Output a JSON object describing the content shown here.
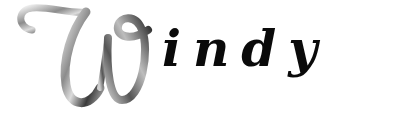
{
  "logo": {
    "word": "Windy",
    "initial": "W",
    "rest": "indy",
    "colors": {
      "initial_light": "#e8e8e8",
      "initial_mid": "#9a9a9a",
      "initial_dark": "#2a2a2a",
      "text": "#0a0a0a",
      "background": "#ffffff"
    }
  }
}
